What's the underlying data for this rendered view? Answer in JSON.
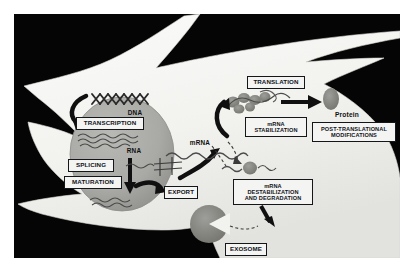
{
  "figure": {
    "background_color": "#050505",
    "cell_color": "#f2f2ef",
    "nucleus_color": "#a9a9a6",
    "label_box_fill": "#f4f4f2",
    "label_box_stroke": "#14171a",
    "arrow_color": "#101010"
  },
  "nucleus": {
    "dna_label": "DNA",
    "rna_label": "RNA",
    "transcription": "TRANSCRIPTION",
    "splicing": "SPLICING",
    "maturation": "MATURATION"
  },
  "transport": {
    "export": "EXPORT",
    "mrna_label": "mRNA"
  },
  "translation_branch": {
    "translation": "TRANSLATION",
    "mrna_stabilization": "mRNA\nSTABILIZATION",
    "protein": "Protein",
    "post_translational": "POST-TRANSLATIONAL\nMODIFICATIONS"
  },
  "degradation_branch": {
    "mrna_destabilization": "mRNA\nDESTABILIZATION\nAND DEGRADATION",
    "exosome": "EXOSOME"
  }
}
